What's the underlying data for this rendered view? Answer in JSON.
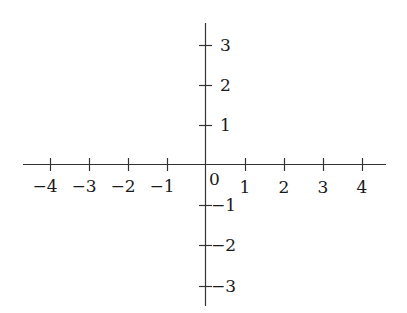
{
  "diagram": {
    "type": "cartesian-axes",
    "colors": {
      "axis": "#333333",
      "text": "#1a1a1a",
      "background": "#ffffff"
    },
    "origin_label": "0",
    "x_axis": {
      "ticks": [
        -4,
        -3,
        -2,
        -1,
        1,
        2,
        3,
        4
      ],
      "tick_labels": [
        "−4",
        "−3",
        "−2",
        "−1",
        "1",
        "2",
        "3",
        "4"
      ]
    },
    "y_axis": {
      "ticks": [
        3,
        2,
        1,
        -1,
        -2,
        -3
      ],
      "tick_labels": [
        "3",
        "2",
        "1",
        "−1",
        "−2",
        "−3"
      ]
    }
  }
}
